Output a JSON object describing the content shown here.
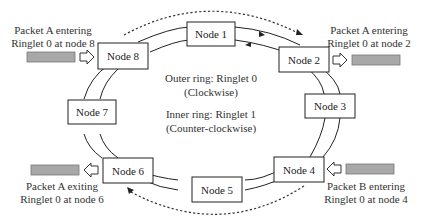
{
  "diagram": {
    "type": "dual-ring network topology",
    "nodes": [
      {
        "id": "node1",
        "label": "Node 1"
      },
      {
        "id": "node2",
        "label": "Node 2"
      },
      {
        "id": "node3",
        "label": "Node 3"
      },
      {
        "id": "node4",
        "label": "Node 4"
      },
      {
        "id": "node5",
        "label": "Node 5"
      },
      {
        "id": "node6",
        "label": "Node 6"
      },
      {
        "id": "node7",
        "label": "Node 7"
      },
      {
        "id": "node8",
        "label": "Node 8"
      }
    ],
    "legend": {
      "outer_line1": "Outer ring: Ringlet 0",
      "outer_line2": "(Clockwise)",
      "inner_line1": "Inner ring: Ringlet 1",
      "inner_line2": "(Counter-clockwise)"
    },
    "packets": [
      {
        "id": "packet-a-node8",
        "line1": "Packet A entering",
        "line2": "Ringlet 0 at node 8",
        "direction": "in"
      },
      {
        "id": "packet-a-node2",
        "line1": "Packet A entering",
        "line2": "Ringlet 0 at node 2",
        "direction": "out"
      },
      {
        "id": "packet-a-node6",
        "line1": "Packet A exiting",
        "line2": "Ringlet 0 at node 6",
        "direction": "out"
      },
      {
        "id": "packet-b-node4",
        "line1": "Packet B entering",
        "line2": "Ringlet 0 at node 4",
        "direction": "in"
      }
    ],
    "colors": {
      "stroke": "#222222",
      "packet_fill": "#a8a8a8",
      "background": "#ffffff"
    }
  }
}
